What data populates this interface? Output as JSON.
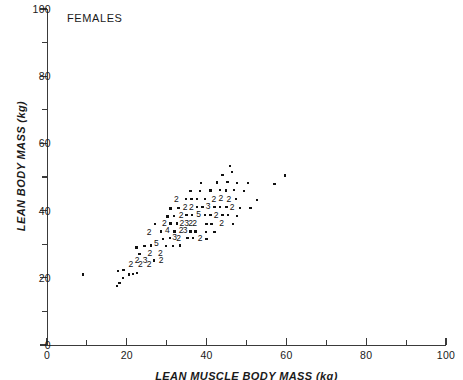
{
  "figure": {
    "panel_label": "FEMALES",
    "type": "scatter"
  },
  "chart_data": {
    "type": "scatter",
    "title": "FEMALES",
    "xlabel": "LEAN MUSCLE BODY MASS (kg)",
    "ylabel": "LEAN BODY MASS (kg)",
    "xlim": [
      0,
      100
    ],
    "ylim": [
      0,
      100
    ],
    "xticks": [
      0,
      20,
      40,
      60,
      80,
      100
    ],
    "yticks": [
      0,
      20,
      40,
      60,
      80,
      100
    ],
    "xticks_minor": [
      10,
      30,
      50,
      70,
      90
    ],
    "yticks_minor": [
      10,
      30,
      50,
      70,
      90
    ],
    "grid": false,
    "legend": null,
    "overplot_note": "Digits mark coincident observations; a digit n means n points share that location.",
    "points": [
      {
        "x": 9.0,
        "y": 21.0,
        "n": 1
      },
      {
        "x": 17.5,
        "y": 17.5,
        "n": 1
      },
      {
        "x": 18.2,
        "y": 18.5,
        "n": 1
      },
      {
        "x": 19.0,
        "y": 20.0,
        "n": 1
      },
      {
        "x": 17.8,
        "y": 22.0,
        "n": 1
      },
      {
        "x": 19.2,
        "y": 22.4,
        "n": 1
      },
      {
        "x": 20.5,
        "y": 21.0,
        "n": 1
      },
      {
        "x": 21.6,
        "y": 21.2,
        "n": 1
      },
      {
        "x": 22.5,
        "y": 21.4,
        "n": 1
      },
      {
        "x": 21.0,
        "y": 23.8,
        "n": 2
      },
      {
        "x": 23.4,
        "y": 23.8,
        "n": 2
      },
      {
        "x": 25.6,
        "y": 23.8,
        "n": 2
      },
      {
        "x": 22.6,
        "y": 25.2,
        "n": 2
      },
      {
        "x": 24.6,
        "y": 25.2,
        "n": 3
      },
      {
        "x": 26.8,
        "y": 25.2,
        "n": 1
      },
      {
        "x": 28.6,
        "y": 25.0,
        "n": 2
      },
      {
        "x": 23.2,
        "y": 27.0,
        "n": 1
      },
      {
        "x": 25.8,
        "y": 27.2,
        "n": 2
      },
      {
        "x": 28.4,
        "y": 27.2,
        "n": 2
      },
      {
        "x": 22.4,
        "y": 29.0,
        "n": 1
      },
      {
        "x": 24.4,
        "y": 29.4,
        "n": 1
      },
      {
        "x": 26.0,
        "y": 29.6,
        "n": 1
      },
      {
        "x": 27.4,
        "y": 30.2,
        "n": 5
      },
      {
        "x": 29.8,
        "y": 29.4,
        "n": 1
      },
      {
        "x": 31.6,
        "y": 29.4,
        "n": 1
      },
      {
        "x": 33.4,
        "y": 29.6,
        "n": 1
      },
      {
        "x": 29.0,
        "y": 31.6,
        "n": 1
      },
      {
        "x": 30.8,
        "y": 31.8,
        "n": 1
      },
      {
        "x": 32.0,
        "y": 32.0,
        "n": 3
      },
      {
        "x": 33.0,
        "y": 31.8,
        "n": 2
      },
      {
        "x": 35.2,
        "y": 31.8,
        "n": 1
      },
      {
        "x": 36.6,
        "y": 31.8,
        "n": 1
      },
      {
        "x": 38.4,
        "y": 31.8,
        "n": 2
      },
      {
        "x": 40.0,
        "y": 31.6,
        "n": 1
      },
      {
        "x": 25.6,
        "y": 33.6,
        "n": 2
      },
      {
        "x": 28.6,
        "y": 33.8,
        "n": 1
      },
      {
        "x": 30.2,
        "y": 34.0,
        "n": 4
      },
      {
        "x": 32.0,
        "y": 33.8,
        "n": 1
      },
      {
        "x": 33.6,
        "y": 34.0,
        "n": 2
      },
      {
        "x": 34.6,
        "y": 34.0,
        "n": 3
      },
      {
        "x": 36.0,
        "y": 33.8,
        "n": 1
      },
      {
        "x": 37.2,
        "y": 33.8,
        "n": 1
      },
      {
        "x": 39.8,
        "y": 33.6,
        "n": 1
      },
      {
        "x": 42.0,
        "y": 33.6,
        "n": 1
      },
      {
        "x": 27.0,
        "y": 36.0,
        "n": 1
      },
      {
        "x": 29.4,
        "y": 36.2,
        "n": 2
      },
      {
        "x": 31.0,
        "y": 36.2,
        "n": 1
      },
      {
        "x": 32.6,
        "y": 36.2,
        "n": 1
      },
      {
        "x": 33.8,
        "y": 36.2,
        "n": 2
      },
      {
        "x": 35.0,
        "y": 36.2,
        "n": 3
      },
      {
        "x": 36.0,
        "y": 36.2,
        "n": 2
      },
      {
        "x": 37.0,
        "y": 36.2,
        "n": 2
      },
      {
        "x": 40.0,
        "y": 36.0,
        "n": 1
      },
      {
        "x": 41.2,
        "y": 36.0,
        "n": 1
      },
      {
        "x": 43.8,
        "y": 36.2,
        "n": 2
      },
      {
        "x": 46.6,
        "y": 36.0,
        "n": 1
      },
      {
        "x": 30.2,
        "y": 38.2,
        "n": 1
      },
      {
        "x": 31.8,
        "y": 38.4,
        "n": 1
      },
      {
        "x": 33.6,
        "y": 38.6,
        "n": 2
      },
      {
        "x": 35.0,
        "y": 38.6,
        "n": 1
      },
      {
        "x": 36.4,
        "y": 38.6,
        "n": 1
      },
      {
        "x": 38.0,
        "y": 38.8,
        "n": 5
      },
      {
        "x": 39.6,
        "y": 38.6,
        "n": 1
      },
      {
        "x": 41.0,
        "y": 38.6,
        "n": 1
      },
      {
        "x": 42.4,
        "y": 38.6,
        "n": 2
      },
      {
        "x": 44.0,
        "y": 38.6,
        "n": 1
      },
      {
        "x": 45.4,
        "y": 38.6,
        "n": 1
      },
      {
        "x": 47.6,
        "y": 38.4,
        "n": 1
      },
      {
        "x": 31.0,
        "y": 40.6,
        "n": 1
      },
      {
        "x": 33.0,
        "y": 40.8,
        "n": 1
      },
      {
        "x": 34.6,
        "y": 41.0,
        "n": 2
      },
      {
        "x": 36.2,
        "y": 41.0,
        "n": 2
      },
      {
        "x": 37.6,
        "y": 41.0,
        "n": 1
      },
      {
        "x": 39.0,
        "y": 41.0,
        "n": 1
      },
      {
        "x": 40.4,
        "y": 41.2,
        "n": 3
      },
      {
        "x": 42.0,
        "y": 41.0,
        "n": 1
      },
      {
        "x": 43.4,
        "y": 41.0,
        "n": 1
      },
      {
        "x": 45.0,
        "y": 41.0,
        "n": 1
      },
      {
        "x": 46.4,
        "y": 41.0,
        "n": 2
      },
      {
        "x": 48.4,
        "y": 40.8,
        "n": 1
      },
      {
        "x": 51.0,
        "y": 40.8,
        "n": 1
      },
      {
        "x": 32.4,
        "y": 43.2,
        "n": 2
      },
      {
        "x": 34.8,
        "y": 43.4,
        "n": 1
      },
      {
        "x": 36.2,
        "y": 43.4,
        "n": 1
      },
      {
        "x": 37.6,
        "y": 43.4,
        "n": 1
      },
      {
        "x": 39.6,
        "y": 43.4,
        "n": 1
      },
      {
        "x": 41.8,
        "y": 43.4,
        "n": 2
      },
      {
        "x": 43.6,
        "y": 43.6,
        "n": 2
      },
      {
        "x": 45.6,
        "y": 43.4,
        "n": 2
      },
      {
        "x": 47.4,
        "y": 43.4,
        "n": 1
      },
      {
        "x": 52.6,
        "y": 43.2,
        "n": 1
      },
      {
        "x": 36.0,
        "y": 45.8,
        "n": 1
      },
      {
        "x": 38.4,
        "y": 45.8,
        "n": 1
      },
      {
        "x": 41.0,
        "y": 46.0,
        "n": 1
      },
      {
        "x": 43.4,
        "y": 46.2,
        "n": 1
      },
      {
        "x": 44.8,
        "y": 46.0,
        "n": 1
      },
      {
        "x": 46.8,
        "y": 46.2,
        "n": 1
      },
      {
        "x": 49.4,
        "y": 45.8,
        "n": 1
      },
      {
        "x": 38.6,
        "y": 48.2,
        "n": 1
      },
      {
        "x": 42.6,
        "y": 48.4,
        "n": 1
      },
      {
        "x": 45.2,
        "y": 48.6,
        "n": 1
      },
      {
        "x": 47.6,
        "y": 48.2,
        "n": 1
      },
      {
        "x": 50.4,
        "y": 48.2,
        "n": 1
      },
      {
        "x": 57.0,
        "y": 48.0,
        "n": 1
      },
      {
        "x": 44.0,
        "y": 50.6,
        "n": 1
      },
      {
        "x": 46.4,
        "y": 51.4,
        "n": 1
      },
      {
        "x": 59.6,
        "y": 50.4,
        "n": 1
      },
      {
        "x": 45.8,
        "y": 53.2,
        "n": 1
      }
    ]
  }
}
